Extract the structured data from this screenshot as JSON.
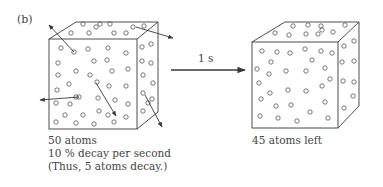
{
  "panel_label": "(b)",
  "arrow_label": "1 s",
  "left_cube": {
    "caption_lines": [
      "50 atoms",
      "10 % decay per second",
      "(Thus, 5 atoms decay.)"
    ],
    "atom_count": 50,
    "decaying_atoms": 5
  },
  "right_cube": {
    "caption": "45 atoms left",
    "atom_count": 45
  },
  "colors": {
    "line": "#3a3a3a",
    "background": "#ffffff"
  }
}
